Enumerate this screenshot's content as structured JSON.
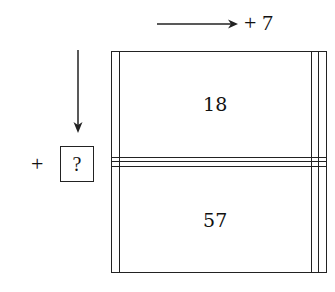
{
  "diagram": {
    "row_operation": {
      "direction": "right",
      "label": "+ 7"
    },
    "column_operation": {
      "direction": "down",
      "sign": "+",
      "unknown": "?"
    },
    "grid": {
      "rows": 4,
      "cols": 4,
      "cells": [
        [
          "",
          "18",
          "",
          ""
        ],
        [
          "",
          "",
          "",
          ""
        ],
        [
          "",
          "",
          "",
          ""
        ],
        [
          "",
          "57",
          "",
          ""
        ]
      ]
    }
  }
}
